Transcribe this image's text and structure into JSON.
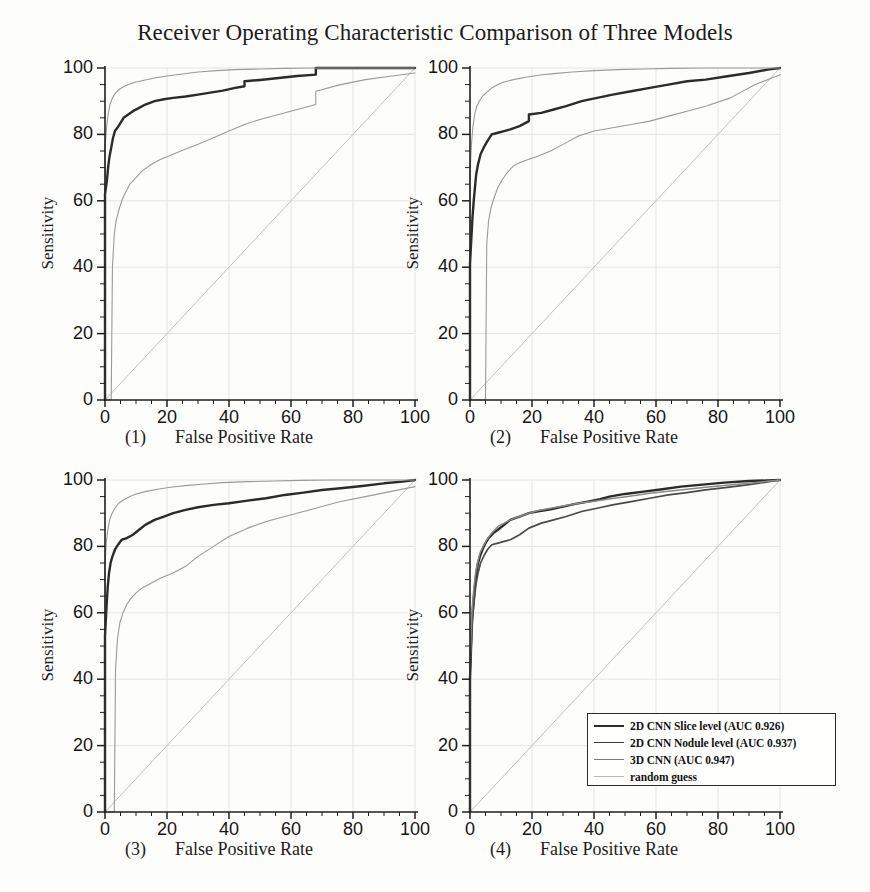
{
  "title": "Receiver Operating Characteristic Comparison of Three Models",
  "axes": {
    "ylabel": "Sensitivity",
    "xlabel": "False Positive Rate",
    "xticks": [
      "0",
      "20",
      "40",
      "60",
      "80",
      "100"
    ],
    "yticks": [
      "0",
      "20",
      "40",
      "60",
      "80",
      "100"
    ],
    "xlim": [
      0,
      100
    ],
    "ylim": [
      0,
      100
    ]
  },
  "panels": [
    {
      "num": "(1)",
      "caption": "False Positive Rate"
    },
    {
      "num": "(2)",
      "caption": "False Positive Rate"
    },
    {
      "num": "(3)",
      "caption": "False Positive Rate"
    },
    {
      "num": "(4)",
      "caption": "False Positive Rate"
    }
  ],
  "legend": {
    "items": [
      {
        "label": "2D CNN Slice level (AUC 0.926)",
        "color": "#2b2b2b",
        "width": 2.2
      },
      {
        "label": "2D CNN Nodule level (AUC 0.937)",
        "color": "#3a3a3a",
        "width": 1.8
      },
      {
        "label": "3D CNN (AUC 0.947)",
        "color": "#7a7a7a",
        "width": 1.5
      },
      {
        "label": "random guess",
        "color": "#b8b8b8",
        "width": 1.2
      }
    ]
  },
  "colors": {
    "main_curve": "#2b2b2b",
    "band_curve": "#9a9a9a",
    "diagonal": "#c0c0c0",
    "grid": "#e4e4e4",
    "axis": "#1f1f1f",
    "background": "#fdfdfb"
  },
  "chart_data": {
    "type": "line",
    "title": "Receiver Operating Characteristic Comparison of Three Models",
    "xlabel": "False Positive Rate",
    "ylabel": "Sensitivity",
    "xlim": [
      0,
      100
    ],
    "ylim": [
      0,
      100
    ],
    "xticks": [
      0,
      20,
      40,
      60,
      80,
      100
    ],
    "yticks": [
      0,
      20,
      40,
      60,
      80,
      100
    ],
    "grid": true,
    "legend_position": "lower-right of panel 4",
    "panels": [
      {
        "id": "(1)",
        "name": "2D CNN Slice level",
        "auc": 0.926,
        "series": [
          {
            "name": "2D CNN Slice level (ROC)",
            "style": "bold",
            "x": [
              0,
              0,
              0.6,
              1.0,
              1.4,
              1.8,
              2.2,
              2.6,
              3.2,
              4.0,
              5.0,
              6.0,
              7.5,
              9.0,
              11,
              13,
              16,
              19,
              22,
              26,
              30,
              34,
              38,
              42,
              45,
              45,
              50,
              56,
              62,
              68,
              68,
              75,
              82,
              90,
              100
            ],
            "y": [
              0,
              62,
              66,
              70,
              73,
              75,
              77,
              79,
              81,
              82,
              83.5,
              85,
              86,
              87,
              88,
              89,
              90,
              90.6,
              91,
              91.4,
              92,
              92.6,
              93.2,
              94,
              94.5,
              96,
              96.4,
              97,
              97.6,
              98,
              100,
              100,
              100,
              100,
              100
            ]
          },
          {
            "name": "upper confidence band",
            "style": "thin",
            "x": [
              0,
              0,
              0.5,
              1.0,
              1.6,
              2.4,
              3.4,
              4.6,
              6.2,
              8.0,
              10,
              13,
              16,
              20,
              25,
              30,
              36,
              42,
              50,
              58,
              66,
              75,
              85,
              100
            ],
            "y": [
              0,
              76,
              82,
              86,
              89,
              91,
              92.5,
              93.6,
              94.5,
              95.2,
              95.8,
              96.4,
              97,
              97.6,
              98.2,
              98.8,
              99.2,
              99.5,
              99.7,
              99.9,
              100,
              100,
              100,
              100
            ]
          },
          {
            "name": "lower confidence band",
            "style": "thin",
            "x": [
              0,
              2.0,
              2.4,
              3.0,
              3.6,
              4.4,
              5.4,
              6.6,
              8.0,
              10,
              12,
              15,
              18,
              22,
              26,
              30,
              35,
              40,
              45,
              50,
              56,
              62,
              68,
              68,
              76,
              84,
              92,
              100
            ],
            "y": [
              0,
              0,
              40,
              50,
              54,
              57,
              60,
              62.5,
              65,
              67,
              69,
              71,
              72.5,
              74,
              75.6,
              77,
              79,
              81,
              83,
              84.5,
              86,
              87.5,
              89,
              93,
              95,
              96.5,
              97.5,
              98.5
            ]
          },
          {
            "name": "random guess",
            "style": "diagonal",
            "x": [
              0,
              100
            ],
            "y": [
              0,
              100
            ]
          }
        ]
      },
      {
        "id": "(2)",
        "name": "2D CNN Nodule level",
        "auc": 0.937,
        "series": [
          {
            "name": "2D CNN Nodule level (ROC)",
            "style": "bold",
            "x": [
              0,
              0,
              0.4,
              0.8,
              1.2,
              1.6,
              2.0,
              2.6,
              3.4,
              4.4,
              5.6,
              7.0,
              9.0,
              11,
              13,
              16,
              19,
              19,
              23,
              27,
              31,
              36,
              41,
              46,
              52,
              58,
              64,
              70,
              76,
              83,
              90,
              96,
              100
            ],
            "y": [
              0,
              41,
              48,
              55,
              60,
              64,
              68,
              71,
              74,
              76,
              78,
              80,
              80.5,
              81,
              81.5,
              82.5,
              84,
              86,
              86.5,
              87.5,
              88.5,
              90,
              91,
              92,
              93,
              94,
              95,
              96,
              96.5,
              97.5,
              98.5,
              99.5,
              100
            ]
          },
          {
            "name": "upper confidence band",
            "style": "thin",
            "x": [
              0,
              0,
              0.4,
              0.9,
              1.5,
              2.2,
              3.0,
              4.0,
              5.2,
              7.0,
              9,
              11,
              14,
              18,
              22,
              27,
              33,
              40,
              48,
              56,
              65,
              75,
              86,
              100
            ],
            "y": [
              0,
              68,
              76,
              82,
              86,
              88.5,
              90,
              91.5,
              92.5,
              94,
              95,
              95.8,
              96.5,
              97.2,
              97.8,
              98.3,
              98.8,
              99.2,
              99.5,
              99.7,
              99.9,
              100,
              100,
              100
            ]
          },
          {
            "name": "lower confidence band",
            "style": "thin",
            "x": [
              0,
              5.0,
              5.4,
              6.0,
              6.8,
              7.8,
              9.0,
              10.5,
              12,
              14,
              16,
              19,
              22,
              26,
              30,
              35,
              40,
              46,
              52,
              58,
              64,
              70,
              76,
              84,
              92,
              100
            ],
            "y": [
              0,
              0,
              47,
              54,
              58,
              61,
              64,
              66.5,
              68.5,
              70.5,
              71.5,
              72.5,
              73.5,
              75,
              77,
              79.5,
              81,
              82,
              83,
              84,
              85.5,
              87,
              88.5,
              91,
              95,
              98
            ]
          },
          {
            "name": "random guess",
            "style": "diagonal",
            "x": [
              0,
              100
            ],
            "y": [
              0,
              100
            ]
          }
        ]
      },
      {
        "id": "(3)",
        "name": "3D CNN",
        "auc": 0.947,
        "series": [
          {
            "name": "3D CNN (ROC)",
            "style": "bold",
            "x": [
              0,
              0,
              0.5,
              0.9,
              1.3,
              1.8,
              2.4,
              3.2,
              4.2,
              5.4,
              7.0,
              9.0,
              11,
              13,
              16,
              19,
              22,
              26,
              30,
              35,
              40,
              46,
              52,
              58,
              64,
              70,
              76,
              83,
              90,
              96,
              100
            ],
            "y": [
              0,
              53,
              62,
              68,
              72,
              75,
              77,
              79,
              80.5,
              82,
              82.5,
              83.5,
              85,
              86.5,
              88,
              89,
              90,
              91,
              91.8,
              92.5,
              93,
              93.8,
              94.5,
              95.5,
              96.2,
              97,
              97.5,
              98.2,
              99,
              99.5,
              100
            ]
          },
          {
            "name": "upper confidence band",
            "style": "thin",
            "x": [
              0,
              0,
              0.4,
              0.9,
              1.5,
              2.3,
              3.2,
              4.4,
              6.0,
              8.0,
              10,
              13,
              17,
              21,
              26,
              32,
              38,
              46,
              54,
              63,
              73,
              85,
              100
            ],
            "y": [
              0,
              74,
              81,
              85,
              88,
              90,
              91.5,
              93,
              94,
              95,
              95.8,
              96.5,
              97.2,
              97.8,
              98.3,
              98.8,
              99.2,
              99.5,
              99.7,
              99.9,
              100,
              100,
              100
            ]
          },
          {
            "name": "lower confidence band",
            "style": "thin",
            "x": [
              0,
              3.0,
              3.4,
              4.0,
              4.8,
              5.8,
              7.0,
              8.5,
              10,
              12,
              15,
              18,
              22,
              26,
              30,
              35,
              40,
              46,
              52,
              58,
              64,
              70,
              76,
              84,
              92,
              100
            ],
            "y": [
              0,
              0,
              43,
              52,
              57,
              60,
              62.5,
              64.5,
              66,
              67.5,
              69,
              70.5,
              72,
              74,
              77,
              80,
              83,
              85.5,
              87.5,
              89,
              90.5,
              92,
              93.5,
              95,
              96.5,
              98
            ]
          },
          {
            "name": "random guess",
            "style": "diagonal",
            "x": [
              0,
              100
            ],
            "y": [
              0,
              100
            ]
          }
        ]
      },
      {
        "id": "(4)",
        "name": "All three models overlaid",
        "series": [
          {
            "name": "2D CNN Slice level (AUC 0.926)",
            "style": "bold",
            "x": [
              0,
              0,
              0.6,
              1.0,
              1.4,
              1.8,
              2.2,
              2.6,
              3.2,
              4.0,
              5.0,
              6.0,
              7.5,
              9.0,
              11,
              13,
              16,
              19,
              22,
              26,
              30,
              34,
              38,
              42,
              45,
              50,
              56,
              62,
              68,
              75,
              82,
              90,
              100
            ],
            "y": [
              0,
              40,
              57,
              62,
              66,
              70,
              73,
              75,
              77,
              79,
              81,
              82.5,
              84,
              85,
              86.5,
              88,
              89,
              90,
              90.6,
              91.2,
              92,
              92.8,
              93.5,
              94.2,
              95,
              95.8,
              96.5,
              97.2,
              98,
              98.6,
              99.2,
              99.7,
              100
            ]
          },
          {
            "name": "2D CNN Nodule level (AUC 0.937)",
            "style": "medium",
            "x": [
              0,
              0,
              0.4,
              0.8,
              1.2,
              1.6,
              2.0,
              2.6,
              3.4,
              4.4,
              5.6,
              7.0,
              9.0,
              11,
              13,
              16,
              19,
              23,
              27,
              31,
              36,
              41,
              46,
              52,
              58,
              64,
              70,
              76,
              83,
              90,
              96,
              100
            ],
            "y": [
              0,
              41,
              50,
              58,
              62,
              66,
              69,
              72,
              75,
              77,
              79,
              80.5,
              81,
              81.5,
              82,
              83.5,
              85.5,
              87,
              88,
              89,
              90.5,
              91.5,
              92.5,
              93.5,
              94.5,
              95.5,
              96.2,
              97,
              97.8,
              98.6,
              99.4,
              100
            ]
          },
          {
            "name": "3D CNN (AUC 0.947)",
            "style": "light",
            "x": [
              0,
              0,
              0.5,
              0.9,
              1.3,
              1.8,
              2.4,
              3.2,
              4.2,
              5.4,
              7.0,
              9.0,
              11,
              13,
              16,
              19,
              22,
              26,
              30,
              35,
              40,
              46,
              52,
              58,
              64,
              70,
              76,
              83,
              90,
              96,
              100
            ],
            "y": [
              0,
              45,
              58,
              64,
              68,
              72,
              75,
              78,
              80,
              82,
              84,
              86,
              87,
              88,
              89,
              90,
              90.8,
              91.5,
              92.2,
              93,
              93.6,
              94.4,
              95.2,
              96,
              96.6,
              97.2,
              97.8,
              98.4,
              99,
              99.6,
              100
            ]
          },
          {
            "name": "random guess",
            "style": "diagonal",
            "x": [
              0,
              100
            ],
            "y": [
              0,
              100
            ]
          }
        ]
      }
    ]
  }
}
